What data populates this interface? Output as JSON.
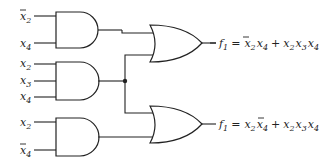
{
  "diagram": {
    "type": "logic-circuit",
    "and_gates": [
      {
        "id": "and1",
        "inputs": [
          {
            "var": "x",
            "sub": "2",
            "negated": true
          },
          {
            "var": "x",
            "sub": "4",
            "negated": false
          }
        ]
      },
      {
        "id": "and2",
        "inputs": [
          {
            "var": "x",
            "sub": "2",
            "negated": false
          },
          {
            "var": "x",
            "sub": "3",
            "negated": false
          },
          {
            "var": "x",
            "sub": "4",
            "negated": false
          }
        ]
      },
      {
        "id": "and3",
        "inputs": [
          {
            "var": "x",
            "sub": "2",
            "negated": false
          },
          {
            "var": "x",
            "sub": "4",
            "negated": true
          }
        ]
      }
    ],
    "or_gates": [
      {
        "id": "or1",
        "inputs": [
          "and1",
          "and2"
        ]
      },
      {
        "id": "or2",
        "inputs": [
          "and2",
          "and3"
        ]
      }
    ],
    "outputs": [
      {
        "name": "f",
        "sub": "1",
        "equals": "=",
        "terms": [
          [
            {
              "v": "x",
              "s": "2",
              "bar": true
            },
            {
              "v": "x",
              "s": "4",
              "bar": false
            }
          ],
          [
            {
              "v": "x",
              "s": "2",
              "bar": false
            },
            {
              "v": "x",
              "s": "3",
              "bar": false
            },
            {
              "v": "x",
              "s": "4",
              "bar": false
            }
          ]
        ]
      },
      {
        "name": "f",
        "sub": "1",
        "equals": "=",
        "terms": [
          [
            {
              "v": "x",
              "s": "2",
              "bar": false
            },
            {
              "v": "x",
              "s": "4",
              "bar": true
            }
          ],
          [
            {
              "v": "x",
              "s": "2",
              "bar": false
            },
            {
              "v": "x",
              "s": "3",
              "bar": false
            },
            {
              "v": "x",
              "s": "4",
              "bar": false
            }
          ]
        ]
      }
    ],
    "labels": {
      "x": "x",
      "s2": "2",
      "s3": "3",
      "s4": "4",
      "f": "f",
      "s1": "1",
      "eq": "=",
      "plus": "+"
    }
  }
}
